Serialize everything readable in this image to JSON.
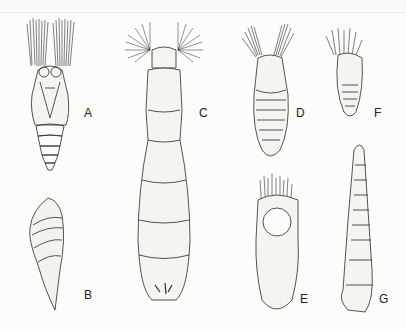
{
  "figure": {
    "panels": [
      {
        "id": "A",
        "label": "A",
        "description": "specimen with paired feathery plumes, segmented abdomen"
      },
      {
        "id": "B",
        "label": "B",
        "description": "conical twisted shell"
      },
      {
        "id": "C",
        "label": "C",
        "description": "elongated segmented body with two plume tufts"
      },
      {
        "id": "D",
        "label": "D",
        "description": "specimen with paired plumes, oval segmented body"
      },
      {
        "id": "E",
        "label": "E",
        "description": "elongate capsule with dense bristle crown"
      },
      {
        "id": "F",
        "label": "F",
        "description": "small specimen with branched tentacle crown"
      },
      {
        "id": "G",
        "label": "G",
        "description": "slender tubular segmented body"
      }
    ],
    "colors": {
      "ink": "#2a2a2a",
      "paper": "#fcfcfa"
    }
  }
}
